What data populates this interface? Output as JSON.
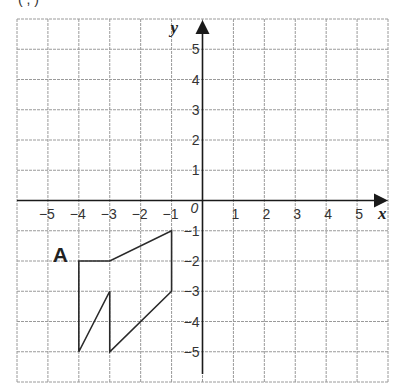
{
  "header": {
    "cropped_text": "( ,  )"
  },
  "grid": {
    "x_min": -6,
    "x_max": 6,
    "y_min": -6,
    "y_max": 6,
    "left_px": 17,
    "right_px": 388,
    "top_px": 19,
    "bottom_px": 382,
    "line_color": "#9a9a9a",
    "axis_color": "#1a1a1a"
  },
  "axes": {
    "x_label": "x",
    "y_label": "y",
    "origin_label": "0",
    "x_ticks": [
      {
        "value": -5,
        "label": "−5"
      },
      {
        "value": -4,
        "label": "−4"
      },
      {
        "value": -3,
        "label": "−3"
      },
      {
        "value": -2,
        "label": "−2"
      },
      {
        "value": -1,
        "label": "−1"
      },
      {
        "value": 1,
        "label": "1"
      },
      {
        "value": 2,
        "label": "2"
      },
      {
        "value": 3,
        "label": "3"
      },
      {
        "value": 4,
        "label": "4"
      },
      {
        "value": 5,
        "label": "5"
      }
    ],
    "y_ticks": [
      {
        "value": 5,
        "label": "5"
      },
      {
        "value": 4,
        "label": "4"
      },
      {
        "value": 3,
        "label": "3"
      },
      {
        "value": 2,
        "label": "2"
      },
      {
        "value": 1,
        "label": "1"
      },
      {
        "value": -1,
        "label": "−1"
      },
      {
        "value": -2,
        "label": "−2"
      },
      {
        "value": -3,
        "label": "−3"
      },
      {
        "value": -4,
        "label": "−4"
      },
      {
        "value": -5,
        "label": "−5"
      }
    ]
  },
  "shapes": [
    {
      "label": "A",
      "label_pos": [
        -4.6,
        -1.7
      ],
      "vertices": [
        [
          -4,
          -2
        ],
        [
          -3,
          -2
        ],
        [
          -1,
          -1
        ],
        [
          -1,
          -3
        ],
        [
          -3,
          -5
        ],
        [
          -3,
          -3
        ],
        [
          -4,
          -5
        ]
      ]
    }
  ]
}
